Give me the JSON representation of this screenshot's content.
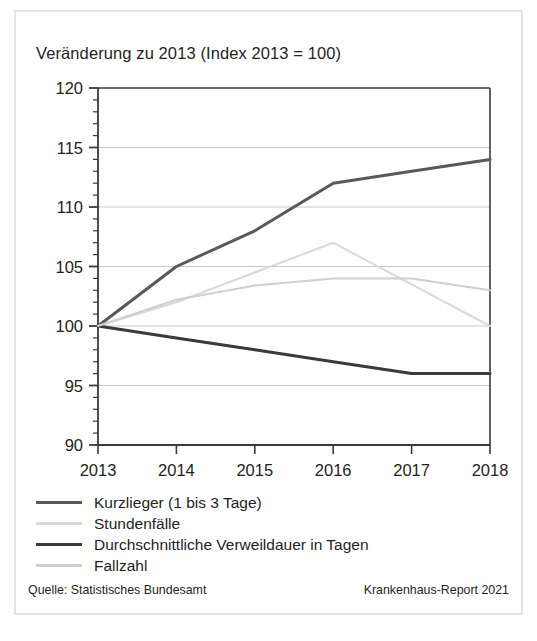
{
  "chart_data": {
    "type": "line",
    "title": "Veränderung zu 2013 (Index 2013 = 100)",
    "xlabel": "",
    "ylabel": "",
    "x": [
      2013,
      2014,
      2015,
      2016,
      2017,
      2018
    ],
    "categories": [
      "2013",
      "2014",
      "2015",
      "2016",
      "2017",
      "2018"
    ],
    "xlim": [
      2013,
      2018
    ],
    "ylim": [
      90,
      120
    ],
    "y_ticks": [
      90,
      95,
      100,
      105,
      110,
      115,
      120
    ],
    "y_tick_labels": [
      "90",
      "95",
      "100",
      "105",
      "110",
      "115",
      "120"
    ],
    "y_minor_step": 1,
    "grid": "horizontal",
    "legend_position": "below",
    "series": [
      {
        "name": "Kurzlieger (1 bis 3 Tage)",
        "values": [
          100,
          105,
          108,
          112,
          113,
          114
        ],
        "color": "#595959",
        "width": 3.0
      },
      {
        "name": "Stundenfälle",
        "values": [
          100,
          102,
          104.5,
          107,
          103.5,
          100
        ],
        "color": "#d9d9d9",
        "width": 2.0
      },
      {
        "name": "Durchschnittliche Verweildauer in Tagen",
        "values": [
          100,
          99,
          98,
          97,
          96,
          96
        ],
        "color": "#3a3a3a",
        "width": 3.0
      },
      {
        "name": "Fallzahl",
        "values": [
          100,
          102.2,
          103.4,
          104,
          104,
          103
        ],
        "color": "#cfcfcf",
        "width": 2.0
      }
    ]
  },
  "legend": {
    "items": [
      {
        "label": "Kurzlieger (1 bis 3 Tage)",
        "color": "#595959",
        "width": 3.0
      },
      {
        "label": "Stundenfälle",
        "color": "#d9d9d9",
        "width": 2.2
      },
      {
        "label": "Durchschnittliche Verweildauer in Tagen",
        "color": "#3a3a3a",
        "width": 3.4
      },
      {
        "label": "Fallzahl",
        "color": "#cfcfcf",
        "width": 2.2
      }
    ]
  },
  "footer": {
    "source": "Quelle: Statistisches Bundesamt",
    "report": "Krankenhaus-Report 2021"
  },
  "style": {
    "axis_color": "#3a3a3a",
    "grid_color": "#c8c8c8",
    "frame_color": "#e3e3e3",
    "text_color": "#231f20",
    "background": "#ffffff"
  }
}
